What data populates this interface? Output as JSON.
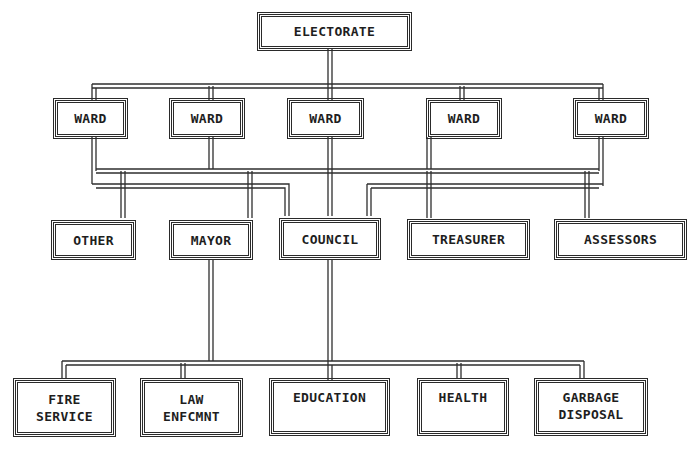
{
  "diagram": {
    "type": "organization-chart",
    "line_color": "#2f2f2f",
    "background": "#ffffff",
    "levels": {
      "top": [
        {
          "id": "electorate",
          "label": "ELECTORATE"
        }
      ],
      "wards": [
        {
          "id": "ward-1",
          "label": "WARD"
        },
        {
          "id": "ward-2",
          "label": "WARD"
        },
        {
          "id": "ward-3",
          "label": "WARD"
        },
        {
          "id": "ward-4",
          "label": "WARD"
        },
        {
          "id": "ward-5",
          "label": "WARD"
        }
      ],
      "officials": [
        {
          "id": "other",
          "label": "OTHER"
        },
        {
          "id": "mayor",
          "label": "MAYOR"
        },
        {
          "id": "council",
          "label": "COUNCIL"
        },
        {
          "id": "treasurer",
          "label": "TREASURER"
        },
        {
          "id": "assessors",
          "label": "ASSESSORS"
        }
      ],
      "departments": [
        {
          "id": "fire-service",
          "lines": [
            "FIRE",
            "SERVICE"
          ]
        },
        {
          "id": "law-enforcement",
          "lines": [
            "LAW",
            "ENFCMNT"
          ]
        },
        {
          "id": "education",
          "lines": [
            "EDUCATION"
          ]
        },
        {
          "id": "health",
          "lines": [
            "HEALTH"
          ]
        },
        {
          "id": "garbage-disposal",
          "lines": [
            "GARBAGE",
            "DISPOSAL"
          ]
        }
      ]
    },
    "edges": [
      {
        "from": "electorate",
        "to": "ward-1"
      },
      {
        "from": "electorate",
        "to": "ward-2"
      },
      {
        "from": "electorate",
        "to": "ward-3"
      },
      {
        "from": "electorate",
        "to": "ward-4"
      },
      {
        "from": "electorate",
        "to": "ward-5"
      },
      {
        "from": "wards",
        "to": "other"
      },
      {
        "from": "wards",
        "to": "mayor"
      },
      {
        "from": "wards",
        "to": "council"
      },
      {
        "from": "wards",
        "to": "treasurer"
      },
      {
        "from": "wards",
        "to": "assessors"
      },
      {
        "from": "mayor",
        "to": "fire-service"
      },
      {
        "from": "mayor",
        "to": "law-enforcement"
      },
      {
        "from": "council",
        "to": "education"
      },
      {
        "from": "council",
        "to": "health"
      },
      {
        "from": "council",
        "to": "garbage-disposal"
      }
    ]
  }
}
